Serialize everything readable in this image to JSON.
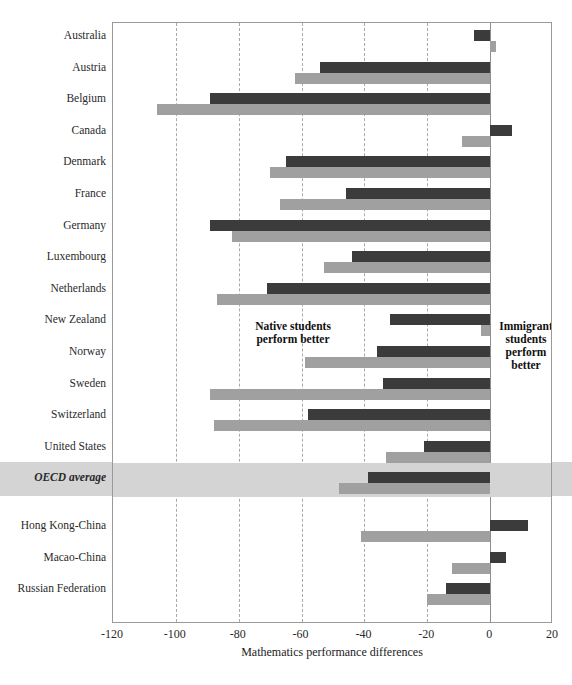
{
  "chart_data": {
    "type": "bar",
    "orientation": "horizontal",
    "title": "",
    "xlabel": "Mathematics performance differences",
    "ylabel": "",
    "xlim": [
      -120,
      20
    ],
    "xticks": [
      -120,
      -100,
      -80,
      -60,
      -40,
      -20,
      0,
      20
    ],
    "grid": true,
    "legend": "none",
    "annotations": [
      {
        "name": "native-side-note",
        "text": "Native students\nperform better",
        "line1": "Native students",
        "line2": "perform better"
      },
      {
        "name": "immigrant-side-note",
        "text": "Immigrant students perform better",
        "line1": "Immigrant",
        "line2": "students",
        "line3": "perform",
        "line4": "better"
      }
    ],
    "colors": {
      "native_bar": "#3b3b3b",
      "immigrant_bar": "#a0a0a0",
      "highlight_band": "#d4d4d4",
      "gridline": "#a9a9a9",
      "axis": "#9a9a9a"
    },
    "series": [
      {
        "name": "First-generation students",
        "color": "#3b3b3b"
      },
      {
        "name": "Second-generation students",
        "color": "#a0a0a0"
      }
    ],
    "categories": [
      "Australia",
      "Austria",
      "Belgium",
      "Canada",
      "Denmark",
      "France",
      "Germany",
      "Luxembourg",
      "Netherlands",
      "New Zealand",
      "Norway",
      "Sweden",
      "Switzerland",
      "United States",
      "OECD average",
      "Hong Kong-China",
      "Macao-China",
      "Russian Federation"
    ],
    "rows": [
      {
        "label": "Australia",
        "highlight": false,
        "spacer_before": false,
        "bars": [
          {
            "series": 0,
            "value": -5
          },
          {
            "series": 1,
            "value": 2
          }
        ]
      },
      {
        "label": "Austria",
        "highlight": false,
        "spacer_before": false,
        "bars": [
          {
            "series": 0,
            "value": -54
          },
          {
            "series": 1,
            "value": -62
          }
        ]
      },
      {
        "label": "Belgium",
        "highlight": false,
        "spacer_before": false,
        "bars": [
          {
            "series": 0,
            "value": -89
          },
          {
            "series": 1,
            "value": -106
          }
        ]
      },
      {
        "label": "Canada",
        "highlight": false,
        "spacer_before": false,
        "bars": [
          {
            "series": 0,
            "value": 7
          },
          {
            "series": 1,
            "value": -9
          }
        ]
      },
      {
        "label": "Denmark",
        "highlight": false,
        "spacer_before": false,
        "bars": [
          {
            "series": 0,
            "value": -65
          },
          {
            "series": 1,
            "value": -70
          }
        ]
      },
      {
        "label": "France",
        "highlight": false,
        "spacer_before": false,
        "bars": [
          {
            "series": 0,
            "value": -46
          },
          {
            "series": 1,
            "value": -67
          }
        ]
      },
      {
        "label": "Germany",
        "highlight": false,
        "spacer_before": false,
        "bars": [
          {
            "series": 0,
            "value": -89
          },
          {
            "series": 1,
            "value": -82
          }
        ]
      },
      {
        "label": "Luxembourg",
        "highlight": false,
        "spacer_before": false,
        "bars": [
          {
            "series": 0,
            "value": -44
          },
          {
            "series": 1,
            "value": -53
          }
        ]
      },
      {
        "label": "Netherlands",
        "highlight": false,
        "spacer_before": false,
        "bars": [
          {
            "series": 0,
            "value": -71
          },
          {
            "series": 1,
            "value": -87
          }
        ]
      },
      {
        "label": "New Zealand",
        "highlight": false,
        "spacer_before": false,
        "bars": [
          {
            "series": 0,
            "value": -32
          },
          {
            "series": 1,
            "value": -3
          }
        ]
      },
      {
        "label": "Norway",
        "highlight": false,
        "spacer_before": false,
        "bars": [
          {
            "series": 0,
            "value": -36
          },
          {
            "series": 1,
            "value": -59
          }
        ]
      },
      {
        "label": "Sweden",
        "highlight": false,
        "spacer_before": false,
        "bars": [
          {
            "series": 0,
            "value": -34
          },
          {
            "series": 1,
            "value": -89
          }
        ]
      },
      {
        "label": "Switzerland",
        "highlight": false,
        "spacer_before": false,
        "bars": [
          {
            "series": 0,
            "value": -58
          },
          {
            "series": 1,
            "value": -88
          }
        ]
      },
      {
        "label": "United States",
        "highlight": false,
        "spacer_before": false,
        "bars": [
          {
            "series": 0,
            "value": -21
          },
          {
            "series": 1,
            "value": -33
          }
        ]
      },
      {
        "label": "OECD average",
        "highlight": true,
        "spacer_before": false,
        "bars": [
          {
            "series": 0,
            "value": -39
          },
          {
            "series": 1,
            "value": -48
          }
        ]
      },
      {
        "label": "Hong Kong-China",
        "highlight": false,
        "spacer_before": true,
        "bars": [
          {
            "series": 0,
            "value": 12
          },
          {
            "series": 1,
            "value": -41
          }
        ]
      },
      {
        "label": "Macao-China",
        "highlight": false,
        "spacer_before": false,
        "bars": [
          {
            "series": 0,
            "value": 5
          },
          {
            "series": 1,
            "value": -12
          }
        ]
      },
      {
        "label": "Russian Federation",
        "highlight": false,
        "spacer_before": false,
        "bars": [
          {
            "series": 0,
            "value": -14
          },
          {
            "series": 1,
            "value": -20
          }
        ]
      }
    ]
  },
  "axis": {
    "x_label": "Mathematics performance differences",
    "ticks": [
      "-120",
      "-100",
      "-80",
      "-60",
      "-40",
      "-20",
      "0",
      "20"
    ]
  },
  "annotations": {
    "native_line1": "Native students",
    "native_line2": "perform better",
    "immigrant_line1": "Immigrant",
    "immigrant_line2": "students",
    "immigrant_line3": "perform",
    "immigrant_line4": "better"
  },
  "header": {
    "faint_text": ""
  }
}
